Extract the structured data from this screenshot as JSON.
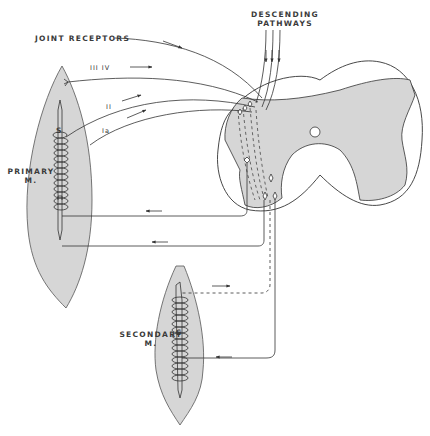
{
  "diagram": {
    "labels": {
      "joint_receptors": "JOINT RECEPTORS",
      "descending_line1": "DESCENDING",
      "descending_line2": "PATHWAYS",
      "primary_line1": "PRIMARY",
      "primary_line2": "M.",
      "secondary_line1": "SECONDARY",
      "secondary_line2": "M.",
      "spindle_primary": "S",
      "spindle_secondary": "S",
      "fiber_iii_iv": "III  IV",
      "fiber_ii": "II",
      "fiber_ia": "Ia"
    },
    "components": [
      "primary muscle",
      "secondary muscle",
      "spinal cord cross-section",
      "joint receptor afferent",
      "group III/IV afferent",
      "group II afferent",
      "group Ia afferent",
      "descending pathways",
      "efferent motor fibers"
    ],
    "colors": {
      "tissue_fill": "#d6d6d6",
      "line": "#333333",
      "background": "#ffffff"
    }
  }
}
